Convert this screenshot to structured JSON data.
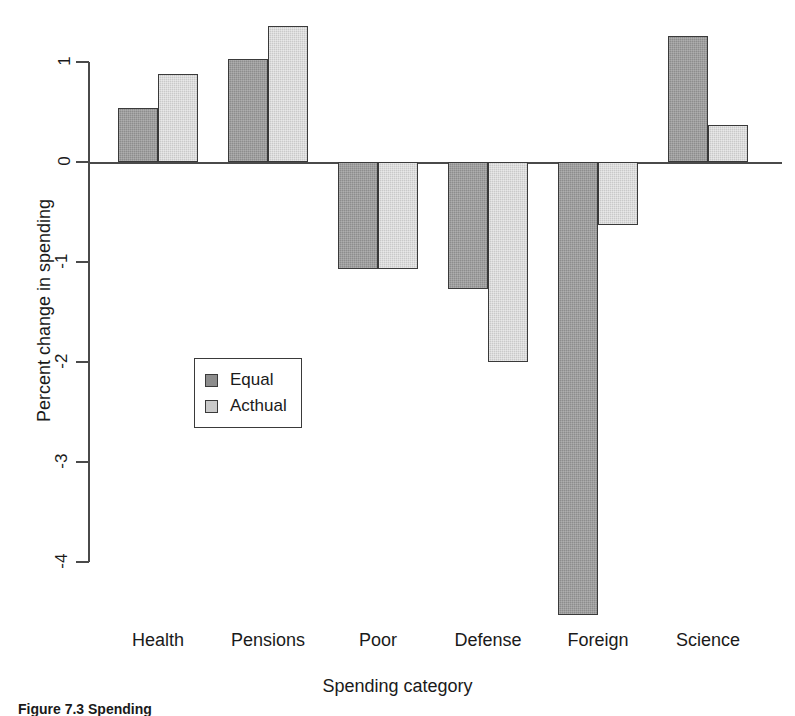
{
  "figure": {
    "caption": "Figure 7.3  Spending"
  },
  "chart_data": {
    "type": "bar",
    "title": "",
    "xlabel": "Spending category",
    "ylabel": "Percent change in spending",
    "categories": [
      "Health",
      "Pensions",
      "Poor",
      "Defense",
      "Foreign",
      "Science"
    ],
    "series": [
      {
        "name": "Equal",
        "values": [
          0.54,
          1.03,
          -1.07,
          -1.27,
          -4.53,
          1.26
        ]
      },
      {
        "name": "Acthual",
        "values": [
          0.88,
          1.36,
          -1.07,
          -2.0,
          -0.63,
          0.37
        ]
      }
    ],
    "ylim": [
      -4.7,
      1.45
    ],
    "yticks": [
      1,
      0,
      -1,
      -2,
      -3,
      -4
    ],
    "ytick_labels": [
      "1",
      "0",
      "-1",
      "-2",
      "-3",
      "-4"
    ],
    "grid": false,
    "legend_position": "center-left",
    "colors": {
      "series_equal": "#8d8d8d",
      "series_actual": "#c9c9c9",
      "axis": "#4a4a4a",
      "bar_border": "#3a3a3a",
      "text": "#1a1a1a",
      "background": "#ffffff"
    }
  }
}
